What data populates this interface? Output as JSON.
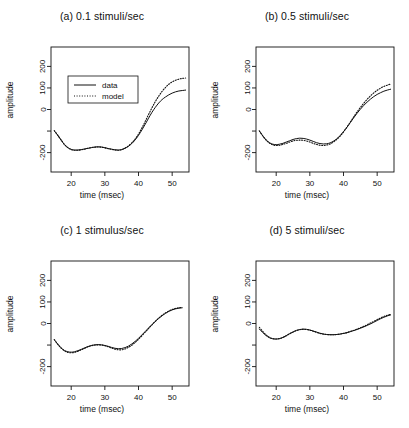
{
  "figure": {
    "background": "#ffffff",
    "ink": "#111111"
  },
  "axes": {
    "xlabel": "time (msec)",
    "ylabel": "amplitude",
    "xlim": [
      14,
      55
    ],
    "ylim": [
      -290,
      290
    ],
    "xticks": [
      20,
      30,
      40,
      50
    ],
    "xtick_labels": [
      "20",
      "30",
      "40",
      "50"
    ],
    "yticks": [
      -200,
      -100,
      0,
      100,
      200
    ],
    "ytick_labels": [
      "-200",
      "",
      "0",
      "100",
      "200"
    ],
    "grid": false
  },
  "legend": {
    "position": "top-left-inside-panel-a",
    "entries": [
      {
        "label": "data",
        "style": "solid"
      },
      {
        "label": "model",
        "style": "dotted"
      }
    ]
  },
  "chart_data": [
    {
      "type": "line",
      "panel": "a",
      "title": "(a) 0.1 stimuli/sec",
      "xlabel": "time (msec)",
      "ylabel": "amplitude",
      "xlim": [
        14,
        55
      ],
      "ylim": [
        -290,
        290
      ],
      "x": [
        15,
        16,
        17,
        18,
        19,
        20,
        21,
        22,
        23,
        24,
        25,
        26,
        27,
        28,
        29,
        30,
        31,
        32,
        33,
        34,
        35,
        36,
        37,
        38,
        39,
        40,
        41,
        42,
        43,
        44,
        45,
        46,
        47,
        48,
        49,
        50,
        51,
        52,
        53,
        54
      ],
      "series": [
        {
          "name": "data",
          "style": "solid",
          "values": [
            -100,
            -120,
            -142,
            -163,
            -177,
            -185,
            -188,
            -188,
            -186,
            -183,
            -180,
            -177,
            -174,
            -173,
            -174,
            -177,
            -181,
            -184,
            -187,
            -188,
            -186,
            -180,
            -171,
            -158,
            -141,
            -120,
            -95,
            -68,
            -40,
            -13,
            10,
            30,
            46,
            58,
            68,
            76,
            82,
            86,
            88,
            90
          ]
        },
        {
          "name": "model",
          "style": "dotted",
          "values": [
            -98,
            -119,
            -141,
            -162,
            -177,
            -186,
            -189,
            -189,
            -187,
            -184,
            -180,
            -177,
            -175,
            -174,
            -175,
            -178,
            -182,
            -185,
            -188,
            -189,
            -186,
            -179,
            -169,
            -155,
            -137,
            -114,
            -86,
            -55,
            -23,
            8,
            37,
            62,
            84,
            102,
            117,
            128,
            136,
            141,
            144,
            146
          ]
        }
      ]
    },
    {
      "type": "line",
      "panel": "b",
      "title": "(b) 0.5 stimuli/sec",
      "xlabel": "time (msec)",
      "ylabel": "amplitude",
      "xlim": [
        14,
        55
      ],
      "ylim": [
        -290,
        290
      ],
      "x": [
        15,
        16,
        17,
        18,
        19,
        20,
        21,
        22,
        23,
        24,
        25,
        26,
        27,
        28,
        29,
        30,
        31,
        32,
        33,
        34,
        35,
        36,
        37,
        38,
        39,
        40,
        41,
        42,
        43,
        44,
        45,
        46,
        47,
        48,
        49,
        50,
        51,
        52,
        53,
        54
      ],
      "series": [
        {
          "name": "data",
          "style": "solid",
          "values": [
            -100,
            -122,
            -141,
            -154,
            -161,
            -163,
            -161,
            -157,
            -151,
            -145,
            -139,
            -135,
            -133,
            -134,
            -137,
            -142,
            -148,
            -154,
            -158,
            -160,
            -159,
            -155,
            -147,
            -136,
            -121,
            -103,
            -83,
            -61,
            -39,
            -18,
            1,
            19,
            34,
            48,
            60,
            70,
            78,
            85,
            90,
            94
          ]
        },
        {
          "name": "model",
          "style": "dotted",
          "values": [
            -99,
            -122,
            -142,
            -156,
            -164,
            -167,
            -166,
            -162,
            -157,
            -151,
            -146,
            -143,
            -142,
            -143,
            -146,
            -151,
            -157,
            -162,
            -166,
            -167,
            -165,
            -160,
            -151,
            -139,
            -123,
            -104,
            -82,
            -59,
            -35,
            -12,
            9,
            29,
            47,
            63,
            77,
            89,
            99,
            107,
            113,
            118
          ]
        }
      ]
    },
    {
      "type": "line",
      "panel": "c",
      "title": "(c) 1 stimulus/sec",
      "xlabel": "time (msec)",
      "ylabel": "amplitude",
      "xlim": [
        14,
        55
      ],
      "ylim": [
        -290,
        290
      ],
      "x": [
        15,
        16,
        17,
        18,
        19,
        20,
        21,
        22,
        23,
        24,
        25,
        26,
        27,
        28,
        29,
        30,
        31,
        32,
        33,
        34,
        35,
        36,
        37,
        38,
        39,
        40,
        41,
        42,
        43,
        44,
        45,
        46,
        47,
        48,
        49,
        50,
        51,
        52,
        53
      ],
      "series": [
        {
          "name": "data",
          "style": "solid",
          "values": [
            -76,
            -96,
            -113,
            -125,
            -131,
            -133,
            -131,
            -126,
            -120,
            -113,
            -107,
            -102,
            -99,
            -98,
            -99,
            -102,
            -106,
            -111,
            -115,
            -117,
            -116,
            -112,
            -105,
            -95,
            -83,
            -69,
            -53,
            -37,
            -21,
            -5,
            10,
            24,
            36,
            47,
            56,
            63,
            68,
            71,
            73
          ]
        },
        {
          "name": "model",
          "style": "dotted",
          "values": [
            -75,
            -96,
            -114,
            -127,
            -134,
            -136,
            -134,
            -129,
            -122,
            -115,
            -108,
            -103,
            -100,
            -99,
            -100,
            -103,
            -108,
            -114,
            -119,
            -122,
            -122,
            -118,
            -111,
            -101,
            -88,
            -73,
            -57,
            -40,
            -23,
            -6,
            10,
            25,
            38,
            49,
            58,
            65,
            70,
            73,
            75
          ]
        }
      ]
    },
    {
      "type": "line",
      "panel": "d",
      "title": "(d) 5 stimuli/sec",
      "xlabel": "time (msec)",
      "ylabel": "amplitude",
      "xlim": [
        14,
        55
      ],
      "ylim": [
        -290,
        290
      ],
      "x": [
        15,
        16,
        17,
        18,
        19,
        20,
        21,
        22,
        23,
        24,
        25,
        26,
        27,
        28,
        29,
        30,
        31,
        32,
        33,
        34,
        35,
        36,
        37,
        38,
        39,
        40,
        41,
        42,
        43,
        44,
        45,
        46,
        47,
        48,
        49,
        50,
        51,
        52,
        53,
        54
      ],
      "series": [
        {
          "name": "data",
          "style": "solid",
          "values": [
            -26,
            -42,
            -56,
            -66,
            -71,
            -72,
            -70,
            -64,
            -56,
            -47,
            -39,
            -32,
            -28,
            -26,
            -27,
            -30,
            -35,
            -40,
            -45,
            -49,
            -51,
            -52,
            -52,
            -51,
            -49,
            -46,
            -43,
            -38,
            -33,
            -28,
            -22,
            -16,
            -9,
            -2,
            6,
            14,
            22,
            29,
            35,
            40
          ]
        },
        {
          "name": "model",
          "style": "dotted",
          "values": [
            -18,
            -37,
            -53,
            -64,
            -70,
            -72,
            -70,
            -65,
            -57,
            -48,
            -40,
            -33,
            -29,
            -27,
            -28,
            -31,
            -36,
            -41,
            -46,
            -49,
            -51,
            -52,
            -52,
            -51,
            -49,
            -46,
            -42,
            -37,
            -32,
            -26,
            -20,
            -13,
            -6,
            2,
            10,
            18,
            26,
            33,
            38,
            42
          ]
        }
      ]
    }
  ]
}
